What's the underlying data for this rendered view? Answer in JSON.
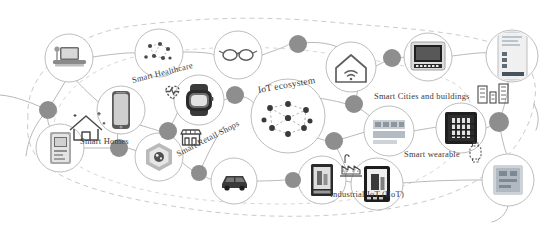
{
  "diagram": {
    "title": "IoT ecosystem",
    "type": "node-link concept map",
    "center_node": {
      "label": "IoT ecosystem",
      "icon": "network-dots-icon",
      "dot_count": 9
    },
    "palette": {
      "background": "#ffffff",
      "circle_stroke": "#b9b9b9",
      "link_stroke": "#b0b0b0",
      "hub_fill": "#8e8e8e",
      "text": "#3a3a3a",
      "icon_dark": "#2e2e2e",
      "icon_mid": "#6f6f6f",
      "icon_light": "#c9c9c9",
      "boundary_stroke": "#c4c4c4"
    },
    "labels": [
      {
        "id": "smart-healthcare",
        "text": "Smart Healthcare",
        "x": 132,
        "y": 76,
        "rotate": -14,
        "size": 8.5
      },
      {
        "id": "smart-homes",
        "text": "Smart Homes",
        "x": 80,
        "y": 137,
        "rotate": 0,
        "size": 8.5
      },
      {
        "id": "smart-retail-shops",
        "text": "Smart Retail Shops",
        "x": 177,
        "y": 150,
        "rotate": -27,
        "size": 8.5
      },
      {
        "id": "iot-ecosystem",
        "text": "IoT ecosystem",
        "x": 258,
        "y": 86,
        "rotate": -10,
        "size": 9.5
      },
      {
        "id": "smart-cities-and-buildings",
        "text": "Smart Cities and buildings",
        "x": 374,
        "y": 92,
        "rotate": 0,
        "size": 8.5
      },
      {
        "id": "smart-wearable",
        "text": "Smart wearable",
        "x": 404,
        "y": 150,
        "rotate": 0,
        "size": 8.5
      },
      {
        "id": "industrial-iiot",
        "text": "Industrial IoT (IIoT)",
        "x": 330,
        "y": 190,
        "rotate": 0,
        "size": 8.5
      }
    ],
    "nodes": [
      {
        "id": "laptop",
        "icon": "laptop-icon",
        "cx": 69,
        "cy": 58,
        "r": 24
      },
      {
        "id": "network-dots-small",
        "icon": "network-dots-icon",
        "cx": 159,
        "cy": 53,
        "r": 24
      },
      {
        "id": "smart-glasses",
        "icon": "smart-glasses-icon",
        "cx": 238,
        "cy": 55,
        "r": 24
      },
      {
        "id": "smart-phone",
        "icon": "smartphone-icon",
        "cx": 121,
        "cy": 110,
        "r": 24
      },
      {
        "id": "smart-watch",
        "icon": "smartwatch-icon",
        "cx": 199,
        "cy": 100,
        "r": 25
      },
      {
        "id": "router-gateway",
        "icon": "router-icon",
        "cx": 60,
        "cy": 148,
        "r": 24
      },
      {
        "id": "smart-appliance",
        "icon": "appliance-icon",
        "cx": 159,
        "cy": 157,
        "r": 24
      },
      {
        "id": "connected-car",
        "icon": "car-icon",
        "cx": 234,
        "cy": 181,
        "r": 23
      },
      {
        "id": "industrial-machine",
        "icon": "industrial-device-icon",
        "cx": 322,
        "cy": 180,
        "r": 24
      },
      {
        "id": "iot-ecosystem-core",
        "icon": "network-dots-icon",
        "cx": 288,
        "cy": 116,
        "r": 37
      },
      {
        "id": "smart-home-wifi",
        "icon": "home-wifi-icon",
        "cx": 351,
        "cy": 67,
        "r": 25
      },
      {
        "id": "smart-display",
        "icon": "monitor-icon",
        "cx": 428,
        "cy": 57,
        "r": 24
      },
      {
        "id": "smart-meter",
        "icon": "meter-panel-icon",
        "cx": 512,
        "cy": 56,
        "r": 26
      },
      {
        "id": "industrial-sensor",
        "icon": "sensor-chart-icon",
        "cx": 389,
        "cy": 131,
        "r": 25
      },
      {
        "id": "server-rack",
        "icon": "server-rack-icon",
        "cx": 461,
        "cy": 128,
        "r": 25
      },
      {
        "id": "wearable-device",
        "icon": "wearable-device-icon",
        "cx": 377,
        "cy": 184,
        "r": 26
      },
      {
        "id": "tablet-device",
        "icon": "tablet-icon",
        "cx": 508,
        "cy": 180,
        "r": 26
      }
    ],
    "hubs": [
      {
        "id": "hub-left",
        "cx": 48,
        "cy": 110,
        "r": 9
      },
      {
        "id": "hub-center-left",
        "cx": 119,
        "cy": 148,
        "r": 9
      },
      {
        "id": "hub-retail",
        "cx": 168,
        "cy": 131,
        "r": 9
      },
      {
        "id": "hub-lower-left",
        "cx": 199,
        "cy": 173,
        "r": 8
      },
      {
        "id": "hub-healthcare",
        "cx": 235,
        "cy": 95,
        "r": 9
      },
      {
        "id": "hub-ecosystem-right",
        "cx": 334,
        "cy": 141,
        "r": 9
      },
      {
        "id": "hub-top-right",
        "cx": 392,
        "cy": 58,
        "r": 9
      },
      {
        "id": "hub-mid-right",
        "cx": 354,
        "cy": 104,
        "r": 9
      },
      {
        "id": "hub-far-right",
        "cx": 499,
        "cy": 122,
        "r": 10
      },
      {
        "id": "hub-top-center",
        "cx": 298,
        "cy": 44,
        "r": 9
      },
      {
        "id": "hub-industrial",
        "cx": 293,
        "cy": 180,
        "r": 8
      }
    ],
    "decor": {
      "house_outline": {
        "id": "smart-homes-house-icon",
        "x": 70,
        "y": 116
      },
      "heart_pulse": {
        "id": "heart-pulse-icon",
        "x": 158,
        "y": 88
      },
      "shop_front": {
        "id": "shop-front-icon",
        "x": 181,
        "y": 131
      },
      "buildings": {
        "id": "city-buildings-icon",
        "x": 478,
        "y": 88
      },
      "small_watch": {
        "id": "small-watch-icon",
        "x": 470,
        "y": 145
      },
      "factory_chart": {
        "id": "factory-chart-icon",
        "x": 345,
        "y": 155
      }
    }
  }
}
